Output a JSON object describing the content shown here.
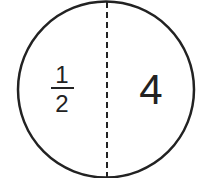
{
  "diagram": {
    "left_numerator": "1",
    "left_denominator": "2",
    "right_value": "4",
    "stroke_color": "#222222",
    "background": "#ffffff"
  }
}
